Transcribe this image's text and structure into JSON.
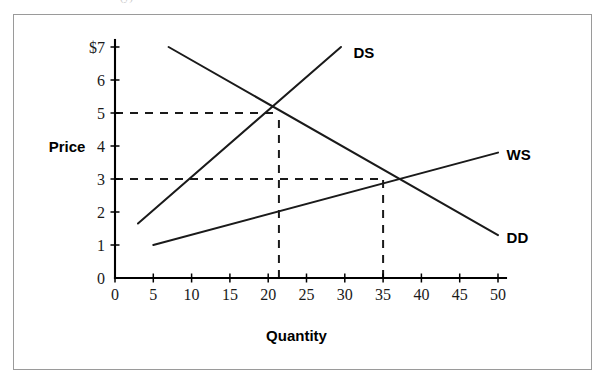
{
  "caption": {
    "text": "(y) · · · · · · · · · · · · · · · · · ·"
  },
  "chart_data": {
    "type": "line",
    "title": "",
    "xlabel": "Quantity",
    "ylabel": "Price",
    "xlim": [
      0,
      50
    ],
    "ylim": [
      0,
      7
    ],
    "grid": false,
    "legend_position": "inline-end-of-line",
    "x_ticks": [
      0,
      5,
      10,
      15,
      20,
      25,
      30,
      35,
      40,
      45,
      50
    ],
    "x_tick_labels": [
      "0",
      "5",
      "10",
      "15",
      "20",
      "25",
      "30",
      "35",
      "40",
      "45",
      "50"
    ],
    "y_ticks": [
      0,
      1,
      2,
      3,
      4,
      5,
      6,
      7
    ],
    "y_tick_labels": [
      "0",
      "1",
      "2",
      "3",
      "4",
      "5",
      "6",
      "7"
    ],
    "y_top_tick_label": "$7",
    "series": [
      {
        "name": "DD",
        "label": "DD",
        "kind": "demand",
        "slope_sign": "negative",
        "points": [
          [
            7,
            7.0
          ],
          [
            50,
            1.3
          ]
        ],
        "label_point": [
          50.6,
          1.25
        ]
      },
      {
        "name": "DS",
        "label": "DS",
        "kind": "supply-domestic",
        "slope_sign": "positive",
        "points": [
          [
            3,
            1.65
          ],
          [
            29.5,
            7.0
          ]
        ],
        "label_point": [
          30.6,
          6.85
        ]
      },
      {
        "name": "WS",
        "label": "WS",
        "kind": "supply-world",
        "slope_sign": "positive",
        "points": [
          [
            5,
            1.0
          ],
          [
            50,
            3.8
          ]
        ],
        "label_point": [
          50.6,
          3.75
        ]
      }
    ],
    "equilibria": [
      {
        "name": "domestic-equilibrium",
        "x": 21.4,
        "y": 5.0,
        "price_label": "5",
        "quantity_label": "21.4",
        "curves": [
          "DD",
          "DS"
        ]
      },
      {
        "name": "world-price-equilibrium",
        "x": 35.0,
        "y": 3.0,
        "price_label": "3",
        "quantity_label": "35",
        "curves": [
          "DD",
          "WS"
        ]
      }
    ],
    "guide_lines": [
      {
        "name": "price-guide-5",
        "orientation": "horizontal",
        "value": 5.0,
        "from": 0,
        "to": 21.4
      },
      {
        "name": "quantity-guide-21",
        "orientation": "vertical",
        "value": 21.4,
        "from": 0,
        "to": 5.0
      },
      {
        "name": "price-guide-3",
        "orientation": "horizontal",
        "value": 3.0,
        "from": 0,
        "to": 35.0
      },
      {
        "name": "quantity-guide-35",
        "orientation": "vertical",
        "value": 35.0,
        "from": 0,
        "to": 3.0
      }
    ],
    "colors": {
      "line": "#1a1a1a",
      "axis": "#000000",
      "frame": "#9a9a9a",
      "background": "#ffffff"
    }
  }
}
